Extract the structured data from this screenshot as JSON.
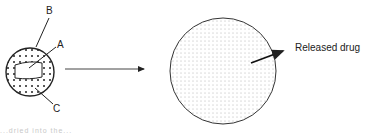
{
  "diagram": {
    "before": {
      "labels": {
        "a": "A",
        "b": "B",
        "c": "C"
      }
    },
    "after": {
      "label": "Released drug"
    },
    "caption_partial": "...dried into the..."
  }
}
